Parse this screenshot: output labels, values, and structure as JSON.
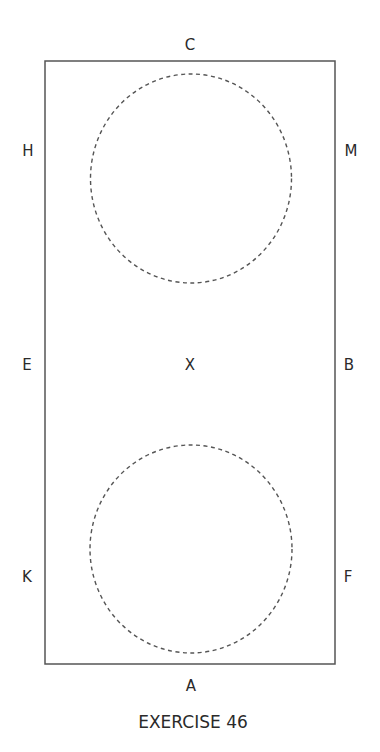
{
  "arena": {
    "letters": {
      "top": "C",
      "bottom": "A",
      "left_top": "H",
      "left_mid": "E",
      "left_bottom": "K",
      "right_top": "M",
      "right_mid": "B",
      "right_bottom": "F",
      "center": "X"
    },
    "circles": [
      {
        "name": "upper-circle",
        "style": "dashed"
      },
      {
        "name": "lower-circle",
        "style": "dashed"
      }
    ],
    "line_color": "#555555"
  },
  "caption": "EXERCISE 46"
}
